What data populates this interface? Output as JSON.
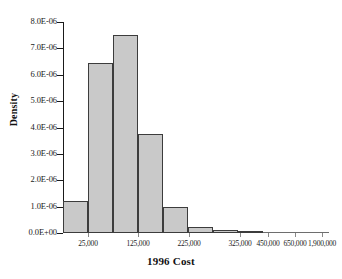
{
  "chart_data": {
    "type": "bar",
    "title": "",
    "xlabel": "1996 Cost",
    "ylabel": "Density",
    "grid": false,
    "legend": false,
    "ylim": [
      0,
      8e-06
    ],
    "ytick_values": [
      0.0,
      1e-06,
      2e-06,
      3e-06,
      4e-06,
      5e-06,
      6e-06,
      7e-06,
      8e-06
    ],
    "ytick_labels": [
      "0.0E+00",
      "1.0E-06",
      "2.0E-06",
      "3.0E-06",
      "4.0E-06",
      "5.0E-06",
      "6.0E-06",
      "7.0E-06",
      "8.0E-06"
    ],
    "xtick_labels": [
      "25,000",
      "125,000",
      "225,000",
      "325,000",
      "450,000",
      "650,000",
      "1,900,000"
    ],
    "xtick_positions_px": [
      88,
      138,
      189,
      240,
      268,
      295,
      322
    ],
    "bins": [
      {
        "label": "25,000",
        "density": 1.22e-06,
        "left_px": 0,
        "width_px": 25
      },
      {
        "label": "75,000",
        "density": 6.45e-06,
        "left_px": 25,
        "width_px": 25
      },
      {
        "label": "125,000",
        "density": 7.5e-06,
        "left_px": 50,
        "width_px": 25
      },
      {
        "label": "175,000",
        "density": 3.77e-06,
        "left_px": 75,
        "width_px": 25
      },
      {
        "label": "225,000",
        "density": 1e-06,
        "left_px": 100,
        "width_px": 25
      },
      {
        "label": "275,000",
        "density": 2.4e-07,
        "left_px": 125,
        "width_px": 25
      },
      {
        "label": "325,000",
        "density": 1.1e-07,
        "left_px": 150,
        "width_px": 25
      },
      {
        "label": "450,000",
        "density": 3.5e-08,
        "left_px": 175,
        "width_px": 25
      }
    ],
    "values": [
      1.22e-06,
      6.45e-06,
      7.5e-06,
      3.77e-06,
      1e-06,
      2.4e-07,
      1.1e-07,
      3.5e-08
    ],
    "categories": [
      "25,000",
      "75,000",
      "125,000",
      "175,000",
      "225,000",
      "275,000",
      "325,000",
      "450,000"
    ],
    "colors": {
      "bar_fill": "#c9c9c9",
      "bar_edge": "#3c3c3c",
      "axis": "#1a1a1a",
      "text": "#1a1a1a"
    }
  }
}
